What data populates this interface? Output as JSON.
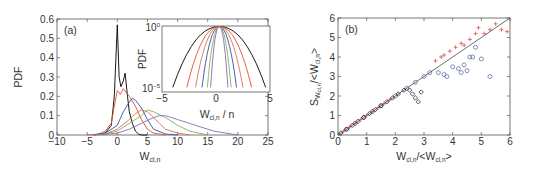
{
  "chart_data": [
    {
      "panel": "(a)",
      "type": "line",
      "title": "",
      "xlabel": "W_cl,n",
      "ylabel": "PDF",
      "xlim": [
        -10,
        25
      ],
      "ylim": [
        0,
        0.6
      ],
      "xticks": [
        -10,
        -5,
        0,
        5,
        10,
        15,
        20,
        25
      ],
      "yticks": [
        0,
        0.1,
        0.2,
        0.3,
        0.4,
        0.5,
        0.6
      ],
      "grid": false,
      "series": [
        {
          "name": "n=1",
          "color": "#000000",
          "x": [
            -4,
            -2,
            -1,
            -0.5,
            0,
            0.3,
            0.6,
            1,
            1.3,
            1.7,
            2,
            2.5,
            3,
            3.5,
            4,
            5
          ],
          "y": [
            0,
            0.01,
            0.05,
            0.2,
            0.57,
            0.3,
            0.25,
            0.28,
            0.32,
            0.2,
            0.12,
            0.06,
            0.02,
            0.005,
            0,
            0
          ]
        },
        {
          "name": "n=2",
          "color": "#e05030",
          "x": [
            -5,
            -3,
            -2,
            -1,
            -0.5,
            0,
            0.5,
            1,
            1.5,
            2,
            3,
            4,
            5,
            6,
            8
          ],
          "y": [
            0,
            0.005,
            0.02,
            0.06,
            0.15,
            0.23,
            0.21,
            0.24,
            0.22,
            0.2,
            0.15,
            0.08,
            0.03,
            0.01,
            0
          ]
        },
        {
          "name": "n=3",
          "color": "#3050a0",
          "x": [
            -4,
            -2,
            0,
            1,
            2,
            2.5,
            3,
            4,
            5,
            6,
            8,
            10
          ],
          "y": [
            0,
            0.01,
            0.05,
            0.12,
            0.17,
            0.19,
            0.18,
            0.14,
            0.08,
            0.03,
            0.005,
            0
          ]
        },
        {
          "name": "n=4",
          "color": "#e07050",
          "x": [
            -4,
            -2,
            0,
            2,
            3,
            4,
            5,
            6,
            7,
            8,
            10,
            12
          ],
          "y": [
            0,
            0.005,
            0.03,
            0.08,
            0.11,
            0.13,
            0.12,
            0.09,
            0.06,
            0.03,
            0.01,
            0
          ]
        },
        {
          "name": "n=5",
          "color": "#80b060",
          "x": [
            -4,
            -2,
            0,
            2,
            4,
            5,
            6,
            8,
            10,
            12,
            15
          ],
          "y": [
            0,
            0.005,
            0.02,
            0.06,
            0.1,
            0.13,
            0.12,
            0.09,
            0.05,
            0.02,
            0
          ]
        },
        {
          "name": "n=6",
          "color": "#8a6ab0",
          "x": [
            -4,
            -2,
            0,
            2,
            4,
            6,
            7,
            8,
            10,
            12,
            14,
            16,
            18,
            20
          ],
          "y": [
            0,
            0.003,
            0.01,
            0.03,
            0.06,
            0.09,
            0.1,
            0.1,
            0.08,
            0.06,
            0.04,
            0.02,
            0.01,
            0
          ]
        }
      ],
      "annotations": [
        "(a)"
      ],
      "inset": {
        "type": "line",
        "xlabel": "W_cl,n / n",
        "ylabel": "PDF",
        "xlim": [
          -5,
          5
        ],
        "yscale": "log",
        "ylim": [
          1e-05,
          1
        ],
        "xticks": [
          -5,
          0,
          5
        ],
        "yticks_labels": [
          "10^0",
          "10^-5"
        ],
        "series_colors": [
          "#000000",
          "#e05030",
          "#3050a0",
          "#80b060",
          "#8a6ab0",
          "#e07050"
        ]
      }
    },
    {
      "panel": "(b)",
      "type": "scatter",
      "title": "",
      "xlabel": "W_cl,n/<W_cl,n>",
      "ylabel": "S_Wcl,n/<W_cl,n>",
      "xlim": [
        0,
        6
      ],
      "ylim": [
        0,
        6
      ],
      "xticks": [
        0,
        1,
        2,
        3,
        4,
        5,
        6
      ],
      "yticks": [
        0,
        1,
        2,
        3,
        4,
        5,
        6
      ],
      "grid": false,
      "reference_line": {
        "x": [
          0,
          6
        ],
        "y": [
          0,
          6
        ],
        "color": "#444444"
      },
      "series": [
        {
          "name": "red crosses",
          "marker": "+",
          "color": "#e05050",
          "x": [
            0.2,
            0.4,
            0.6,
            0.8,
            1.0,
            1.2,
            1.4,
            1.6,
            1.8,
            3.4,
            3.6,
            3.7,
            3.9,
            4.1,
            4.3,
            4.4,
            4.6,
            4.8,
            4.9,
            5.1,
            5.3,
            5.5,
            5.7,
            5.9
          ],
          "y": [
            0.2,
            0.4,
            0.6,
            0.8,
            1.0,
            1.2,
            1.4,
            1.6,
            1.8,
            3.8,
            4.0,
            4.1,
            4.3,
            4.5,
            4.7,
            4.6,
            4.9,
            5.2,
            5.5,
            5.2,
            5.4,
            5.7,
            5.4,
            5.3
          ]
        },
        {
          "name": "blue circles",
          "marker": "o",
          "color": "#5060a0",
          "x": [
            0.3,
            0.6,
            0.9,
            1.2,
            1.5,
            2.0,
            2.4,
            2.7,
            3.0,
            3.2,
            3.5,
            3.7,
            3.8,
            4.0,
            4.2,
            4.3,
            4.4,
            4.5,
            4.6,
            4.7,
            4.8,
            5.0,
            5.3
          ],
          "y": [
            0.3,
            0.6,
            0.9,
            1.2,
            1.5,
            2.0,
            2.4,
            2.7,
            3.0,
            3.2,
            3.2,
            3.1,
            3.0,
            3.5,
            3.4,
            3.2,
            3.6,
            3.3,
            4.0,
            4.0,
            4.5,
            3.9,
            3.0
          ]
        },
        {
          "name": "black diamonds",
          "marker": "d",
          "color": "#111111",
          "x": [
            0.1,
            0.3,
            0.5,
            0.7,
            0.9,
            1.1,
            1.3,
            1.5,
            1.7,
            1.9,
            2.1,
            2.3,
            2.5,
            2.6,
            2.7,
            2.8,
            2.9
          ],
          "y": [
            0.1,
            0.3,
            0.5,
            0.7,
            0.9,
            1.1,
            1.3,
            1.5,
            1.7,
            1.9,
            2.1,
            2.3,
            2.3,
            2.1,
            1.9,
            1.7,
            2.2
          ]
        }
      ],
      "annotations": [
        "(b)"
      ]
    }
  ],
  "labels": {
    "a_panel": "(a)",
    "b_panel": "(b)",
    "a_ylabel": "PDF",
    "a_xlabel_main": "W",
    "a_xlabel_sub": "cl,n",
    "inset_ylabel": "PDF",
    "inset_xlabel_main": "W",
    "inset_xlabel_sub": "cl,n",
    "inset_xlabel_suffix": " / n",
    "inset_ytick_top": "10",
    "inset_ytick_top_exp": "0",
    "inset_ytick_bottom": "10",
    "inset_ytick_bottom_exp": "−5",
    "b_xlabel": "W",
    "b_ylabel": "S"
  }
}
